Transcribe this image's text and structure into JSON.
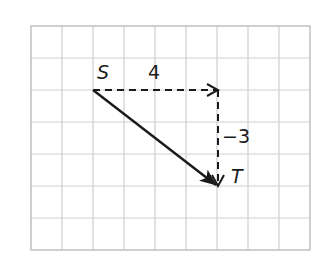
{
  "diagram": {
    "type": "vector-translation-grid",
    "grid": {
      "columns": 9,
      "rows": 7,
      "origin_px": [
        31,
        26
      ],
      "cell_w": 31,
      "cell_h": 32,
      "line_color": "#cfcfcf"
    },
    "points": [
      {
        "name": "S",
        "label": "S",
        "grid": [
          2,
          2
        ]
      },
      {
        "name": "T",
        "label": "T",
        "grid": [
          6,
          5
        ]
      }
    ],
    "vectors": [
      {
        "name": "horizontal-component",
        "from": [
          2,
          2
        ],
        "to": [
          6,
          2
        ],
        "style": "dashed",
        "label": "4"
      },
      {
        "name": "vertical-component",
        "from": [
          6,
          2
        ],
        "to": [
          6,
          5
        ],
        "style": "dashed",
        "label": "−3"
      },
      {
        "name": "resultant",
        "from": [
          2,
          2
        ],
        "to": [
          6,
          5
        ],
        "style": "solid",
        "label": ""
      }
    ],
    "labels": {
      "point_s": "S",
      "point_t": "T",
      "horizontal": "4",
      "vertical": "−3"
    },
    "colors": {
      "arrow": "#1a1a1a",
      "text": "#1a1a1a"
    }
  }
}
